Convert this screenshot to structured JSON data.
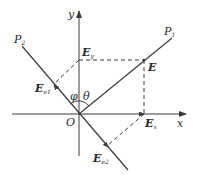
{
  "diagram": {
    "type": "vector-decomposition",
    "origin": {
      "label": "O",
      "x": 79,
      "y": 114
    },
    "axes": {
      "x": {
        "label": "x"
      },
      "y": {
        "label": "y"
      }
    },
    "lines": [
      {
        "id": "P1",
        "label": "P",
        "subscript": "1"
      },
      {
        "id": "P2",
        "label": "P",
        "subscript": "2"
      }
    ],
    "vector": {
      "label": "E"
    },
    "components": {
      "Ey": {
        "label": "E",
        "subscript": "y"
      },
      "Ex": {
        "label": "E",
        "subscript": "x"
      },
      "Ee1": {
        "label": "E",
        "subscript": "e1"
      },
      "Ee2": {
        "label": "E",
        "subscript": "e2"
      }
    },
    "angles": {
      "phi": "φ",
      "theta": "θ"
    },
    "colors": {
      "line": "#3a3a3a",
      "background": "#ffffff"
    }
  }
}
